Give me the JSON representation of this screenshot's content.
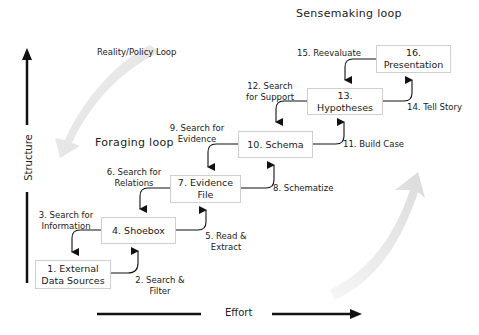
{
  "diagram": {
    "loops": {
      "sensemaking": "Sensemaking loop",
      "foraging": "Foraging loop",
      "reality_policy": "Reality/Policy Loop"
    },
    "axes": {
      "y_label": "Structure",
      "x_label": "Effort"
    },
    "boxes": [
      {
        "id": 1,
        "line1": "1. External",
        "line2": "Data Sources"
      },
      {
        "id": 4,
        "line1": "4. Shoebox",
        "line2": ""
      },
      {
        "id": 7,
        "line1": "7. Evidence",
        "line2": "File"
      },
      {
        "id": 10,
        "line1": "10. Schema",
        "line2": ""
      },
      {
        "id": 13,
        "line1": "13. Hypotheses",
        "line2": ""
      },
      {
        "id": 16,
        "line1": "16. Presentation",
        "line2": ""
      }
    ],
    "edges": [
      {
        "id": 2,
        "line1": "2. Search &",
        "line2": "Filter"
      },
      {
        "id": 3,
        "line1": "3. Search for",
        "line2": "Information"
      },
      {
        "id": 5,
        "line1": "5. Read &",
        "line2": "Extract"
      },
      {
        "id": 6,
        "line1": "6. Search for",
        "line2": "Relations"
      },
      {
        "id": 8,
        "line1": "8. Schematize",
        "line2": ""
      },
      {
        "id": 9,
        "line1": "9. Search for",
        "line2": "Evidence"
      },
      {
        "id": 11,
        "line1": "11. Build Case",
        "line2": ""
      },
      {
        "id": 12,
        "line1": "12. Search",
        "line2": "for Support"
      },
      {
        "id": 14,
        "line1": "14. Tell Story",
        "line2": ""
      },
      {
        "id": 15,
        "line1": "15. Reevaluate",
        "line2": ""
      }
    ],
    "colors": {
      "box_border": "#cfcfcf",
      "arrow": "#111111",
      "loop_arrow": "#e4e4e4",
      "text": "#1a1a1a"
    }
  }
}
